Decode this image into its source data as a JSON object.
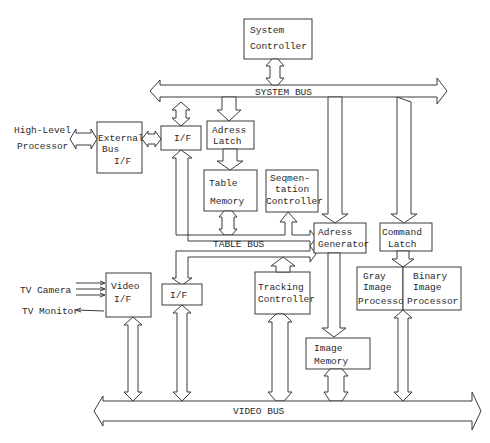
{
  "diagram": {
    "blocks": {
      "system_controller": {
        "line1": "System",
        "line2": "Controller"
      },
      "external_bus_if": {
        "line1": "External",
        "line2": "Bus",
        "line3": "I/F"
      },
      "if_upper": {
        "line1": "I/F"
      },
      "adress_latch": {
        "line1": "Adress",
        "line2": "Latch"
      },
      "table_memory": {
        "line1": "Table",
        "line2": "Memory"
      },
      "segmentation_controller": {
        "line1": "Seqmen-",
        "line2": "tation",
        "line3": "Controller"
      },
      "adress_generator": {
        "line1": "Adress",
        "line2": "Generator"
      },
      "command_latch": {
        "line1": "Command",
        "line2": "Latch"
      },
      "video_if": {
        "line1": "Video",
        "line2": "I/F"
      },
      "if_lower": {
        "line1": "I/F"
      },
      "tracking_controller": {
        "line1": "Tracking",
        "line2": "Controller"
      },
      "gray_image_processor": {
        "line1": "Gray",
        "line2": "Image",
        "line3": "Processor"
      },
      "binary_image_processor": {
        "line1": "Binary",
        "line2": "Image",
        "line3": "Processor"
      },
      "image_memory": {
        "line1": "Image",
        "line2": "Memory"
      }
    },
    "buses": {
      "system_bus": "SYSTEM  BUS",
      "table_bus": "TABLE  BUS",
      "video_bus": "VIDEO    BUS"
    },
    "external": {
      "high_level_line1": "High-Level",
      "high_level_line2": "Processor",
      "tv_camera": "TV Camera",
      "tv_monitor": "TV Monitor"
    }
  }
}
